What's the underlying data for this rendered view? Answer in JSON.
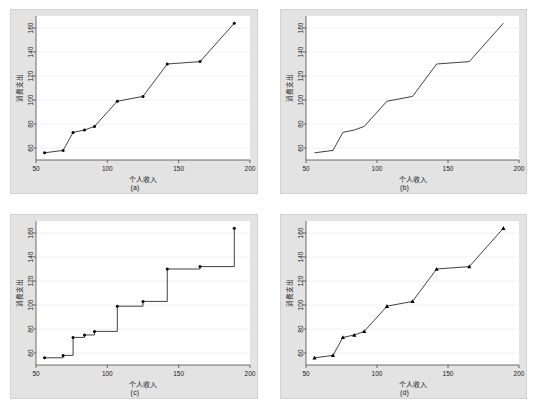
{
  "figure": {
    "panel_count": 4,
    "background_color": "#ffffff",
    "panel_background_color": "#e3e3e3",
    "plot_background_color": "#ffffff",
    "line_color": "#2b2b2b",
    "marker_color": "#000000",
    "gridline_color": "#eef0f2",
    "axis_color": "#4a4a4a",
    "tick_label_color": "#1a1a1a"
  },
  "chart_data": [
    {
      "type": "line",
      "id": "panel-a",
      "title": "",
      "subplot_label": "(a)",
      "xlabel": "个人收入",
      "ylabel": "消费支出",
      "xlim": [
        50,
        200
      ],
      "ylim": [
        50,
        170
      ],
      "xticks": [
        50,
        100,
        150,
        200
      ],
      "yticks": [
        60,
        80,
        100,
        120,
        140,
        160
      ],
      "grid": true,
      "grid_axis": "y",
      "marker": "circle",
      "show_markers": true,
      "step": false,
      "legend": "none",
      "x": [
        56,
        69,
        76,
        84,
        91,
        107,
        125,
        142,
        165,
        189
      ],
      "values": [
        56,
        58,
        73,
        75,
        78,
        99,
        103,
        130,
        132,
        164
      ]
    },
    {
      "type": "line",
      "id": "panel-b",
      "title": "",
      "subplot_label": "(b)",
      "xlabel": "个人收入",
      "ylabel": "消费支出",
      "xlim": [
        50,
        200
      ],
      "ylim": [
        50,
        170
      ],
      "xticks": [
        50,
        100,
        150,
        200
      ],
      "yticks": [
        60,
        80,
        100,
        120,
        140,
        160
      ],
      "grid": true,
      "grid_axis": "y",
      "marker": "none",
      "show_markers": false,
      "step": false,
      "legend": "none",
      "x": [
        56,
        69,
        76,
        84,
        91,
        107,
        125,
        142,
        165,
        189
      ],
      "values": [
        56,
        58,
        73,
        75,
        78,
        99,
        103,
        130,
        132,
        164
      ]
    },
    {
      "type": "line",
      "id": "panel-c",
      "title": "",
      "subplot_label": "(c)",
      "xlabel": "个人收入",
      "ylabel": "消费支出",
      "xlim": [
        50,
        200
      ],
      "ylim": [
        50,
        170
      ],
      "xticks": [
        50,
        100,
        150,
        200
      ],
      "yticks": [
        60,
        80,
        100,
        120,
        140,
        160
      ],
      "grid": true,
      "grid_axis": "y",
      "marker": "circle",
      "show_markers": true,
      "step": true,
      "step_mode": "post",
      "legend": "none",
      "x": [
        56,
        69,
        76,
        84,
        91,
        107,
        125,
        142,
        165,
        189
      ],
      "values": [
        56,
        58,
        73,
        75,
        78,
        99,
        103,
        130,
        132,
        164
      ]
    },
    {
      "type": "line",
      "id": "panel-d",
      "title": "",
      "subplot_label": "(d)",
      "xlabel": "个人收入",
      "ylabel": "消费支出",
      "xlim": [
        50,
        200
      ],
      "ylim": [
        50,
        170
      ],
      "xticks": [
        50,
        100,
        150,
        200
      ],
      "yticks": [
        60,
        80,
        100,
        120,
        140,
        160
      ],
      "grid": true,
      "grid_axis": "y",
      "marker": "triangle",
      "show_markers": true,
      "step": false,
      "legend": "none",
      "x": [
        56,
        69,
        76,
        84,
        91,
        107,
        125,
        142,
        165,
        189
      ],
      "values": [
        56,
        58,
        73,
        75,
        78,
        99,
        103,
        130,
        132,
        164
      ]
    }
  ]
}
